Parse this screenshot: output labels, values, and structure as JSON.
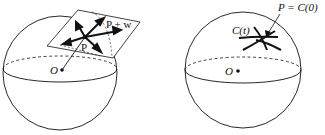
{
  "figure": {
    "left_panel": {
      "description": "Sphere with tangent plane at P; vectors in tangent plane",
      "labels": {
        "point": "P",
        "point_plus_vector": "P + w",
        "origin": "O"
      }
    },
    "right_panel": {
      "description": "Sphere with curves through P on the surface",
      "labels": {
        "curve": "C(t)",
        "point_eq": "P = C(0)",
        "origin": "O"
      }
    },
    "colors": {
      "stroke": "#111111",
      "background": "#ffffff"
    }
  }
}
